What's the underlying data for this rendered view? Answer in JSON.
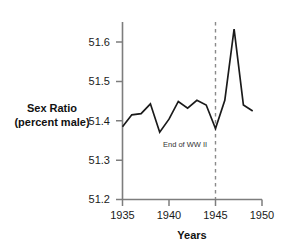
{
  "chart_data": {
    "type": "line",
    "title": "",
    "xlabel": "Years",
    "ylabel": "Sex Ratio (percent male)",
    "ylabel_line1": "Sex Ratio",
    "ylabel_line2": "(percent male)",
    "xlim": [
      1935,
      1950
    ],
    "ylim": [
      51.2,
      51.65
    ],
    "grid": false,
    "legend": null,
    "yticks": [
      "51.2",
      "51.3",
      "51.4",
      "51.5",
      "51.6"
    ],
    "ytick_values": [
      51.2,
      51.3,
      51.4,
      51.5,
      51.6
    ],
    "xticks": [
      "1935",
      "1940",
      "1945",
      "1950"
    ],
    "xtick_values": [
      1935,
      1940,
      1945,
      1950
    ],
    "x": [
      1935,
      1936,
      1937,
      1938,
      1939,
      1940,
      1941,
      1942,
      1943,
      1944,
      1945,
      1946,
      1947,
      1948,
      1949
    ],
    "values": [
      51.385,
      51.415,
      51.418,
      51.443,
      51.371,
      51.404,
      51.449,
      51.432,
      51.452,
      51.44,
      51.38,
      51.452,
      51.633,
      51.44,
      51.425
    ],
    "series": [
      {
        "name": "Sex ratio",
        "color": "#1a1a1a",
        "values": [
          51.385,
          51.415,
          51.418,
          51.443,
          51.371,
          51.404,
          51.449,
          51.432,
          51.452,
          51.44,
          51.38,
          51.452,
          51.633,
          51.44,
          51.425
        ]
      }
    ],
    "annotations": [
      {
        "text": "End of WW II",
        "x": 1945,
        "type": "vertical-dashed-line",
        "line_color": "#8a8a8a",
        "text_color": "#333333"
      }
    ]
  },
  "axis": {
    "line_color": "#7d7d7d",
    "tick_color": "#7d7d7d"
  }
}
